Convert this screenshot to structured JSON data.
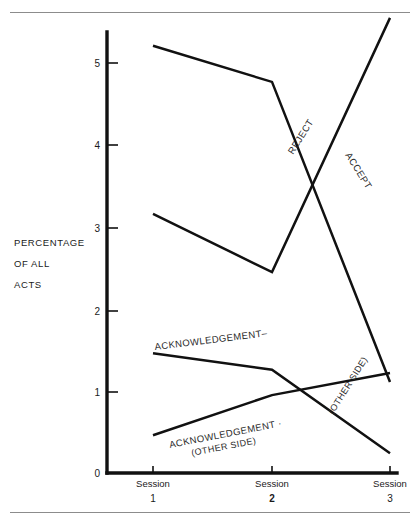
{
  "chart_data": {
    "type": "line",
    "title": "",
    "xlabel": "",
    "ylabel": "PERCENTAGE OF ALL ACTS",
    "ylabel_lines": [
      "PERCENTAGE",
      "OF ALL",
      "ACTS"
    ],
    "categories": [
      "Session 1",
      "Session 2",
      "Session 3"
    ],
    "x_tick_top": [
      "Session",
      "Session",
      "Session"
    ],
    "x_tick_bottom": [
      "1",
      "2",
      "3"
    ],
    "y_ticks": [
      "0",
      "1",
      "2",
      "3",
      "4",
      "5"
    ],
    "ylim": [
      0,
      5.7
    ],
    "grid": false,
    "legend_position": "inline-annotations",
    "series": [
      {
        "name": "REJECT",
        "label": "REJECT",
        "label_style": "rotated",
        "values": [
          5.21,
          4.77,
          1.11
        ]
      },
      {
        "name": "ACCEPT",
        "label": "ACCEPT",
        "label_style": "rotated",
        "values": [
          3.16,
          2.45,
          5.55
        ]
      },
      {
        "name": "ACKNOWLEDGEMENT",
        "label": "ACKNOWLEDGEMENT",
        "label_style": "rotated",
        "values": [
          1.46,
          1.26,
          0.24
        ]
      },
      {
        "name": "ACKNOWLEDGEMENT (OTHER SIDE)",
        "label": "ACKNOWLEDGEMENT",
        "label_line2": "(OTHER SIDE)",
        "label_right": "(OTHER SIDE)",
        "label_style": "rotated",
        "values": [
          0.46,
          0.95,
          1.22
        ]
      }
    ],
    "annotations": [
      {
        "text": "REJECT",
        "x": 293,
        "y": 155,
        "rotation": -58
      },
      {
        "text": "ACCEPT",
        "x": 345,
        "y": 155,
        "rotation": 58
      },
      {
        "text": "ACKNOWLEDGEMENT–",
        "x": 155,
        "y": 350,
        "rotation": -7
      },
      {
        "text": "ACKNOWLEDGEMENT ·",
        "x": 170,
        "y": 448,
        "rotation": -11
      },
      {
        "text": "(OTHER SIDE)",
        "x": 192,
        "y": 456,
        "rotation": -11
      },
      {
        "text": "(OTHER SIDE)",
        "x": 333,
        "y": 415,
        "rotation": -58
      }
    ],
    "colors": {
      "line": "#111111",
      "axis": "#111111",
      "text": "#1a1a1a",
      "rule": "#8c8c8c",
      "background": "#ffffff"
    }
  }
}
